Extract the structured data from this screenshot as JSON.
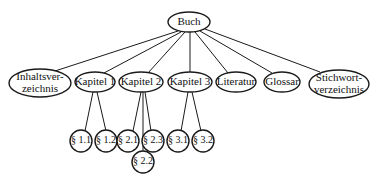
{
  "diagram": {
    "type": "tree",
    "root": {
      "id": "buch",
      "label": "Buch"
    },
    "level1": [
      {
        "id": "inhaltsverzeichnis",
        "lines": [
          "Inhaltsver-",
          "zeichnis"
        ]
      },
      {
        "id": "kapitel-1",
        "label": "Kapitel 1"
      },
      {
        "id": "kapitel-2",
        "label": "Kapitel 2"
      },
      {
        "id": "kapitel-3",
        "label": "Kapitel 3"
      },
      {
        "id": "literatur",
        "label": "Literatur"
      },
      {
        "id": "glossar",
        "label": "Glossar"
      },
      {
        "id": "stichwortverzeichnis",
        "lines": [
          "Stichwort-",
          "verzeichnis"
        ]
      }
    ],
    "level2": [
      {
        "id": "s1-1",
        "label": "§ 1.1",
        "parent": "kapitel-1"
      },
      {
        "id": "s1-2",
        "label": "§ 1.2",
        "parent": "kapitel-1"
      },
      {
        "id": "s2-1",
        "label": "§ 2.1",
        "parent": "kapitel-2"
      },
      {
        "id": "s2-2",
        "label": "§ 2.2",
        "parent": "kapitel-2"
      },
      {
        "id": "s2-3",
        "label": "§ 2.3",
        "parent": "kapitel-2"
      },
      {
        "id": "s3-1",
        "label": "§ 3.1",
        "parent": "kapitel-3"
      },
      {
        "id": "s3-2",
        "label": "§ 3.2",
        "parent": "kapitel-3"
      }
    ]
  }
}
